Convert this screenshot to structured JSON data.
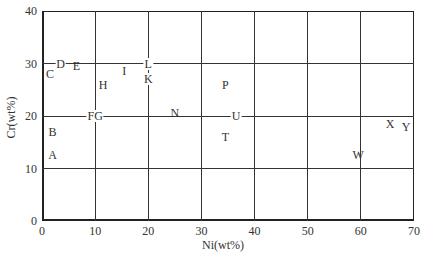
{
  "chart_data": {
    "type": "scatter",
    "title": "",
    "xlabel": "Ni(wt%)",
    "ylabel": "Cr(wt%)",
    "xlim": [
      0,
      70
    ],
    "ylim": [
      0,
      40
    ],
    "grid": true,
    "legend": null,
    "x_ticks": [
      "0",
      "10",
      "20",
      "30",
      "40",
      "50",
      "60",
      "70"
    ],
    "y_ticks": [
      "0",
      "10",
      "20",
      "30",
      "40"
    ],
    "points": [
      {
        "label": "A",
        "x": 2,
        "y": 12.5
      },
      {
        "label": "B",
        "x": 2,
        "y": 17
      },
      {
        "label": "C",
        "x": 1.5,
        "y": 28
      },
      {
        "label": "D",
        "x": 3.5,
        "y": 30
      },
      {
        "label": "E",
        "x": 6.5,
        "y": 29.5
      },
      {
        "label": "FG",
        "x": 10,
        "y": 20
      },
      {
        "label": "H",
        "x": 11.5,
        "y": 26
      },
      {
        "label": "I",
        "x": 15.5,
        "y": 28.5
      },
      {
        "label": "K",
        "x": 20,
        "y": 27
      },
      {
        "label": "L",
        "x": 20,
        "y": 30
      },
      {
        "label": "N",
        "x": 25,
        "y": 20.5
      },
      {
        "label": "P",
        "x": 34.5,
        "y": 26
      },
      {
        "label": "T",
        "x": 34.5,
        "y": 16
      },
      {
        "label": "U",
        "x": 36.5,
        "y": 20
      },
      {
        "label": "W",
        "x": 59.5,
        "y": 12.5
      },
      {
        "label": "X",
        "x": 65.5,
        "y": 18.5
      },
      {
        "label": "Y",
        "x": 68.5,
        "y": 18
      }
    ]
  }
}
